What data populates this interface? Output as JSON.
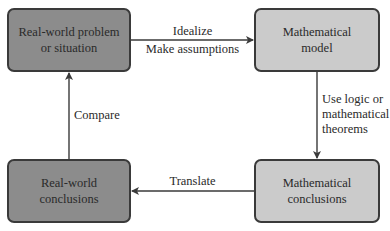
{
  "diagram": {
    "type": "flowchart",
    "top_cut_text": "",
    "nodes": [
      {
        "id": "real_problem",
        "label": "Real-world problem\nor situation",
        "shade": "dark"
      },
      {
        "id": "math_model",
        "label": "Mathematical\nmodel",
        "shade": "light"
      },
      {
        "id": "math_conclusions",
        "label": "Mathematical\nconclusions",
        "shade": "light"
      },
      {
        "id": "real_conclusions",
        "label": "Real-world\nconclusions",
        "shade": "dark"
      }
    ],
    "edges": [
      {
        "from": "real_problem",
        "to": "math_model",
        "label_above": "Idealize",
        "label_below": "Make assumptions"
      },
      {
        "from": "math_model",
        "to": "math_conclusions",
        "label": "Use logic or\nmathematical\ntheorems"
      },
      {
        "from": "math_conclusions",
        "to": "real_conclusions",
        "label": "Translate"
      },
      {
        "from": "real_conclusions",
        "to": "real_problem",
        "label": "Compare"
      }
    ],
    "colors": {
      "dark_fill": "#8c8c8c",
      "light_fill": "#cbcbcb",
      "stroke": "#3a3a3a"
    }
  }
}
